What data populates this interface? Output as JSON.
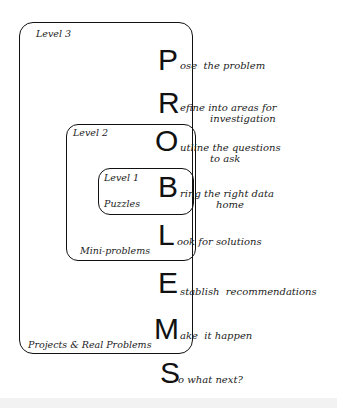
{
  "diagram": {
    "boxes": {
      "level3": {
        "title": "Level 3",
        "footer": "Projects & Real Problems"
      },
      "level2": {
        "title": "Level 2",
        "footer": "Mini-problems"
      },
      "level1": {
        "title": "Level 1",
        "footer": "Puzzles"
      }
    },
    "acronym": "PROBLEMS",
    "steps": [
      {
        "letter": "P",
        "rest": "ose",
        "text": "the problem",
        "text2": ""
      },
      {
        "letter": "R",
        "rest": "efine",
        "text": "into areas for",
        "text2": "investigation"
      },
      {
        "letter": "O",
        "rest": "utline",
        "text": "the questions",
        "text2": "to ask"
      },
      {
        "letter": "B",
        "rest": "ring",
        "text": "the right data",
        "text2": "home"
      },
      {
        "letter": "L",
        "rest": "ook",
        "text": "for solutions",
        "text2": ""
      },
      {
        "letter": "E",
        "rest": "stablish",
        "text": "recommendations",
        "text2": ""
      },
      {
        "letter": "M",
        "rest": "ake",
        "text": "it happen",
        "text2": ""
      },
      {
        "letter": "S",
        "rest": "o",
        "text": "what next?",
        "text2": ""
      }
    ]
  }
}
